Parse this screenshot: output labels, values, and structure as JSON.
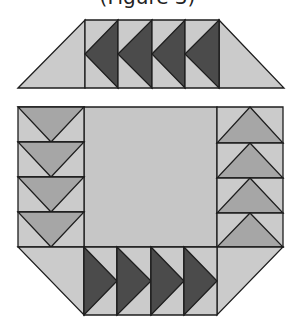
{
  "caption": "(Figure 3)",
  "colors": {
    "light": "#cbcbcb",
    "center": "#c6c6c6",
    "medium": "#a6a6a6",
    "dark": "#4b4b4b",
    "stroke": "#1e1e1e"
  },
  "top_band": {
    "y_top": 20,
    "y_bottom": 88,
    "outer_left_bottom": 18,
    "outer_right_bottom": 284,
    "units_x": [
      85,
      118,
      152,
      185,
      219
    ],
    "geese_direction": "left"
  },
  "bottom_band": {
    "y_top": 247,
    "y_bottom": 315,
    "outer_left_top": 18,
    "outer_right_top": 283,
    "units_x": [
      84,
      117,
      151,
      184,
      217
    ],
    "geese_direction": "right"
  },
  "left_column": {
    "x_left": 18,
    "x_right": 84,
    "rows_y": [
      107,
      142,
      177,
      212,
      247
    ],
    "geese_direction": "down"
  },
  "right_column": {
    "x_left": 217,
    "x_right": 283,
    "rows_y": [
      107,
      143,
      178,
      213,
      247
    ],
    "geese_direction": "up"
  },
  "center_square": {
    "x": 84,
    "y": 107,
    "w": 133,
    "h": 140
  }
}
